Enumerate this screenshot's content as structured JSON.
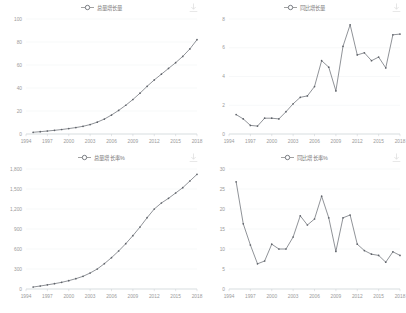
{
  "page": {
    "caption": ""
  },
  "icons": {
    "download": "download-icon",
    "legend_marker": "circle-line-marker"
  },
  "colors": {
    "line": "#6b6f76",
    "grid": "#eef0f2",
    "axis": "#c8ccd0",
    "text": "#9a9a9a"
  },
  "chart_data": [
    {
      "id": "total-volume",
      "type": "line",
      "title": "总量增长量",
      "legend": [
        "总量增长量"
      ],
      "position": "top-left",
      "xlabel": "",
      "ylabel": "",
      "grid": true,
      "legend_position": "top-center",
      "xlim": [
        1994,
        2018
      ],
      "ylim": [
        0,
        100
      ],
      "yticks": [
        0,
        20,
        40,
        60,
        80,
        100
      ],
      "ytick_labels": [
        "0",
        "20",
        "40",
        "60",
        "80",
        "100"
      ],
      "xticks": [
        1994,
        1997,
        2000,
        2003,
        2006,
        2009,
        2012,
        2015,
        2018
      ],
      "x": [
        1995,
        1996,
        1997,
        1998,
        1999,
        2000,
        2001,
        2002,
        2003,
        2004,
        2005,
        2006,
        2007,
        2008,
        2009,
        2010,
        2011,
        2012,
        2013,
        2014,
        2015,
        2016,
        2017,
        2018
      ],
      "values": [
        1.5,
        2.0,
        2.6,
        3.2,
        3.9,
        4.7,
        5.6,
        6.7,
        8.2,
        10.3,
        13.0,
        16.5,
        20.5,
        25.0,
        30.0,
        35.5,
        41.5,
        47.0,
        52.0,
        57.0,
        62.0,
        67.5,
        74.0,
        82.0
      ]
    },
    {
      "id": "yoy-volume",
      "type": "line",
      "title": "同比增长量",
      "legend": [
        "同比增长量"
      ],
      "position": "top-right",
      "xlabel": "",
      "ylabel": "",
      "grid": true,
      "legend_position": "top-center",
      "xlim": [
        1994,
        2018
      ],
      "ylim": [
        0,
        8
      ],
      "yticks": [
        0,
        2,
        4,
        6,
        8
      ],
      "ytick_labels": [
        "0",
        "2",
        "4",
        "6",
        "8"
      ],
      "xticks": [
        1994,
        1997,
        2000,
        2003,
        2006,
        2009,
        2012,
        2015,
        2018
      ],
      "x": [
        1995,
        1996,
        1997,
        1998,
        1999,
        2000,
        2001,
        2002,
        2003,
        2004,
        2005,
        2006,
        2007,
        2008,
        2009,
        2010,
        2011,
        2012,
        2013,
        2014,
        2015,
        2016,
        2017,
        2018
      ],
      "values": [
        1.35,
        1.05,
        0.6,
        0.55,
        1.1,
        1.1,
        1.05,
        1.55,
        2.1,
        2.55,
        2.65,
        3.3,
        5.1,
        4.65,
        3.0,
        6.1,
        7.6,
        5.5,
        5.65,
        5.1,
        5.35,
        4.6,
        6.9,
        6.95
      ]
    },
    {
      "id": "total-growth-pct",
      "type": "line",
      "title": "总量增长率%",
      "legend": [
        "总量增长率%"
      ],
      "position": "bottom-left",
      "xlabel": "",
      "ylabel": "",
      "grid": true,
      "legend_position": "top-center",
      "xlim": [
        1994,
        2018
      ],
      "ylim": [
        0,
        1800
      ],
      "yticks": [
        0,
        300,
        600,
        900,
        1200,
        1500,
        1800
      ],
      "ytick_labels": [
        "0",
        "300",
        "600",
        "900",
        "1,200",
        "1,500",
        "1,800"
      ],
      "xticks": [
        1994,
        1997,
        2000,
        2003,
        2006,
        2009,
        2012,
        2015,
        2018
      ],
      "x": [
        1995,
        1996,
        1997,
        1998,
        1999,
        2000,
        2001,
        2002,
        2003,
        2004,
        2005,
        2006,
        2007,
        2008,
        2009,
        2010,
        2011,
        2012,
        2013,
        2014,
        2015,
        2016,
        2017,
        2018
      ],
      "values": [
        30,
        45,
        62,
        80,
        100,
        125,
        155,
        190,
        240,
        300,
        380,
        470,
        570,
        680,
        800,
        930,
        1070,
        1200,
        1290,
        1360,
        1440,
        1520,
        1620,
        1720
      ]
    },
    {
      "id": "yoy-growth-pct",
      "type": "line",
      "title": "同比增长率%",
      "legend": [
        "同比增长率%"
      ],
      "position": "bottom-right",
      "xlabel": "",
      "ylabel": "",
      "grid": true,
      "legend_position": "top-center",
      "xlim": [
        1994,
        2018
      ],
      "ylim": [
        0,
        30
      ],
      "yticks": [
        0,
        5,
        10,
        15,
        20,
        25,
        30
      ],
      "ytick_labels": [
        "0",
        "5",
        "10",
        "15",
        "20",
        "25",
        "30"
      ],
      "xticks": [
        1994,
        1997,
        2000,
        2003,
        2006,
        2009,
        2012,
        2015,
        2018
      ],
      "x": [
        1995,
        1996,
        1997,
        1998,
        1999,
        2000,
        2001,
        2002,
        2003,
        2004,
        2005,
        2006,
        2007,
        2008,
        2009,
        2010,
        2011,
        2012,
        2013,
        2014,
        2015,
        2016,
        2017,
        2018
      ],
      "values": [
        26.8,
        16.3,
        11.0,
        6.3,
        7.0,
        11.2,
        10.0,
        10.0,
        13.0,
        18.3,
        16.0,
        17.5,
        23.2,
        17.8,
        9.4,
        17.8,
        18.5,
        11.2,
        9.6,
        8.7,
        8.4,
        6.7,
        9.3,
        8.4
      ]
    }
  ]
}
